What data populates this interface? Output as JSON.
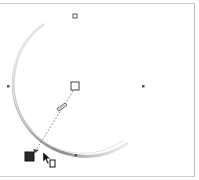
{
  "canvas": {
    "background": "#ffffff",
    "frame_color": "#c8c8c8"
  },
  "object": {
    "type": "circle",
    "center": [
      75,
      86
    ],
    "radius": 68,
    "outline_color": "#9a9a9a"
  },
  "nodes": [
    {
      "name": "top-node",
      "x": 75,
      "y": 16,
      "style": "hollow-square"
    },
    {
      "name": "left-node",
      "x": 8,
      "y": 86,
      "style": "dot"
    },
    {
      "name": "right-node",
      "x": 143,
      "y": 86,
      "style": "dot"
    },
    {
      "name": "bottom-node",
      "x": 76,
      "y": 155,
      "style": "dot"
    }
  ],
  "interactive_tool": {
    "start_handle": {
      "x": 75,
      "y": 86,
      "style": "hollow-square"
    },
    "end_handle": {
      "x": 30,
      "y": 157,
      "style": "filled-square",
      "color": "#2a2a2a"
    },
    "slider": {
      "x": 62,
      "y": 107
    },
    "line_style": "dotted"
  },
  "cursor": {
    "icon": "arrow-pointer-with-document",
    "x": 44,
    "y": 154
  }
}
